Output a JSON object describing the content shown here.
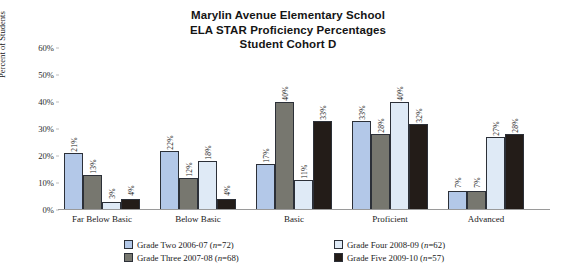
{
  "title": {
    "line1": "Marylin Avenue Elementary School",
    "line2": "ELA STAR Proficiency Percentages",
    "line3": "Student Cohort D"
  },
  "chart_data": {
    "type": "bar",
    "title": "Marylin Avenue Elementary School ELA STAR Proficiency Percentages Student Cohort D",
    "xlabel": "",
    "ylabel": "Percent of Students",
    "ylim": [
      0,
      60
    ],
    "yticks": [
      "0%",
      "10%",
      "20%",
      "30%",
      "40%",
      "50%",
      "60%"
    ],
    "ytick_values": [
      0,
      10,
      20,
      30,
      40,
      50,
      60
    ],
    "grid": false,
    "legend_position": "bottom",
    "categories": [
      "Far Below Basic",
      "Below Basic",
      "Basic",
      "Proficient",
      "Advanced"
    ],
    "series": [
      {
        "name": "Grade Two 2006-07 (n=72)",
        "color": "#b3c8e8",
        "values": [
          21,
          22,
          17,
          33,
          7
        ],
        "labels": [
          "21%",
          "22%",
          "17%",
          "33%",
          "7%"
        ]
      },
      {
        "name": "Grade Three 2007-08 (n=68)",
        "color": "#77776f",
        "values": [
          13,
          12,
          40,
          28,
          7
        ],
        "labels": [
          "13%",
          "12%",
          "40%",
          "28%",
          "7%"
        ]
      },
      {
        "name": "Grade Four 2008-09 (n=62)",
        "color": "#dfeaf6",
        "values": [
          3,
          18,
          11,
          40,
          27
        ],
        "labels": [
          "3%",
          "18%",
          "11%",
          "40%",
          "27%"
        ]
      },
      {
        "name": "Grade Five 2009-10 (n=57)",
        "color": "#231c18",
        "values": [
          4,
          4,
          33,
          32,
          28
        ],
        "labels": [
          "4%",
          "4%",
          "33%",
          "32%",
          "28%"
        ]
      }
    ]
  },
  "legend": {
    "items": [
      {
        "label": "Grade Two 2006-07 (n=72)",
        "color": "#b3c8e8"
      },
      {
        "label": "Grade Four 2008-09 (n=62)",
        "color": "#dfeaf6"
      },
      {
        "label": "Grade Three 2007-08 (n=68)",
        "color": "#77776f"
      },
      {
        "label": "Grade Five 2009-10 (n=57)",
        "color": "#231c18"
      }
    ]
  }
}
